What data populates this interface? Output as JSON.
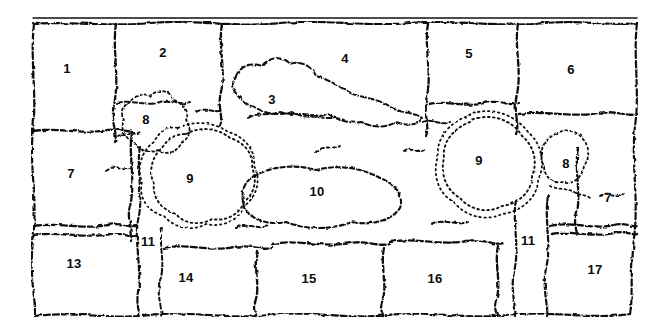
{
  "figure": {
    "kind": "hand-drawn-cell-map",
    "width": 662,
    "height": 334,
    "background_color": "#ffffff",
    "ink_color": "#111111",
    "label_color": "#0b0b0b"
  },
  "frame": {
    "top_rule_label": "straight-top-rule",
    "top_wavy_label": "wavy-top-border",
    "bottom_wavy_label": "wavy-bottom-border",
    "left_border_label": "left-border",
    "right_border_label": "right-border"
  },
  "labels": [
    {
      "id": "label-1",
      "text": "1",
      "x": 67,
      "y": 68
    },
    {
      "id": "label-2",
      "text": "2",
      "x": 163,
      "y": 52
    },
    {
      "id": "label-3",
      "text": "3",
      "x": 272,
      "y": 99
    },
    {
      "id": "label-4",
      "text": "4",
      "x": 345,
      "y": 58
    },
    {
      "id": "label-5",
      "text": "5",
      "x": 469,
      "y": 53
    },
    {
      "id": "label-6",
      "text": "6",
      "x": 571,
      "y": 69
    },
    {
      "id": "label-7-left",
      "text": "7",
      "x": 71,
      "y": 173
    },
    {
      "id": "label-8-left",
      "text": "8",
      "x": 146,
      "y": 119
    },
    {
      "id": "label-9-left",
      "text": "9",
      "x": 190,
      "y": 178
    },
    {
      "id": "label-10",
      "text": "10",
      "x": 317,
      "y": 191
    },
    {
      "id": "label-11-left",
      "text": "11",
      "x": 148,
      "y": 241
    },
    {
      "id": "label-13",
      "text": "13",
      "x": 74,
      "y": 263
    },
    {
      "id": "label-14",
      "text": "14",
      "x": 186,
      "y": 277
    },
    {
      "id": "label-15",
      "text": "15",
      "x": 309,
      "y": 278
    },
    {
      "id": "label-16",
      "text": "16",
      "x": 435,
      "y": 278
    },
    {
      "id": "label-9-right",
      "text": "9",
      "x": 479,
      "y": 160
    },
    {
      "id": "label-8-right",
      "text": "8",
      "x": 566,
      "y": 163
    },
    {
      "id": "label-7-right",
      "text": "7",
      "x": 608,
      "y": 197
    },
    {
      "id": "label-11-right",
      "text": "11",
      "x": 528,
      "y": 240
    },
    {
      "id": "label-17",
      "text": "17",
      "x": 595,
      "y": 269
    }
  ],
  "regions": [
    {
      "id": "region-1",
      "number": "1",
      "style": "solid-dashed"
    },
    {
      "id": "region-2",
      "number": "2",
      "style": "solid-dashed"
    },
    {
      "id": "region-3",
      "number": "3",
      "style": "solid-dashed"
    },
    {
      "id": "region-4",
      "number": "4",
      "style": "solid-dashed"
    },
    {
      "id": "region-5",
      "number": "5",
      "style": "solid-dashed"
    },
    {
      "id": "region-6",
      "number": "6",
      "style": "solid-dashed"
    },
    {
      "id": "region-7",
      "number": "7",
      "style": "solid-dashed"
    },
    {
      "id": "region-8",
      "number": "8",
      "style": "fine-dotted"
    },
    {
      "id": "region-9",
      "number": "9",
      "style": "fine-dotted"
    },
    {
      "id": "region-10",
      "number": "10",
      "style": "solid-dashed"
    },
    {
      "id": "region-11",
      "number": "11",
      "style": "solid-dashed"
    },
    {
      "id": "region-13",
      "number": "13",
      "style": "solid-dashed"
    },
    {
      "id": "region-14",
      "number": "14",
      "style": "solid-dashed"
    },
    {
      "id": "region-15",
      "number": "15",
      "style": "solid-dashed"
    },
    {
      "id": "region-16",
      "number": "16",
      "style": "solid-dashed"
    },
    {
      "id": "region-17",
      "number": "17",
      "style": "solid-dashed"
    }
  ]
}
